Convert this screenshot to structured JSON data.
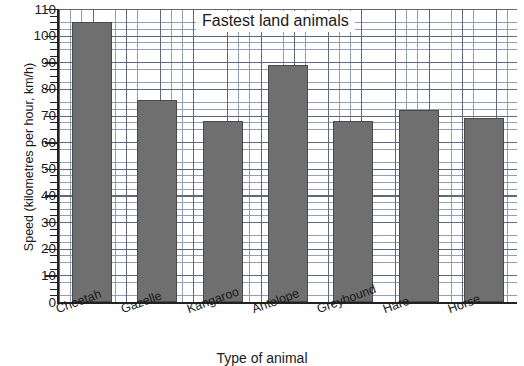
{
  "chart_data": {
    "type": "bar",
    "title": "Fastest land animals",
    "xlabel": "Type of animal",
    "ylabel": "Speed (kilometres per hour, km/h)",
    "categories": [
      "Cheetah",
      "Gazelle",
      "Kangaroo",
      "Antelope",
      "Greyhound",
      "Hare",
      "Horse"
    ],
    "values": [
      105,
      76,
      68,
      89,
      68,
      72,
      69
    ],
    "ylim": [
      0,
      110
    ],
    "ytick_labels": [
      "0",
      "10",
      "20",
      "30",
      "40",
      "50",
      "60",
      "70",
      "80",
      "90",
      "100",
      "110"
    ],
    "ytick_values": [
      0,
      10,
      20,
      30,
      40,
      50,
      60,
      70,
      80,
      90,
      100,
      110
    ],
    "y_major_interval": 10,
    "y_minor_interval": 2.5,
    "grid": "on",
    "legend": "none",
    "bar_color": "#6f6f6f",
    "bar_edge_color": "#4a4a4a",
    "grid_minor_color": "#8f9fb5",
    "grid_major_color": "#5d6a7d",
    "axis_color": "#222222",
    "background_color": "#ffffff"
  }
}
